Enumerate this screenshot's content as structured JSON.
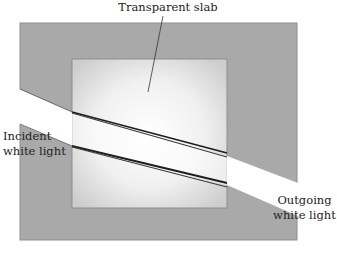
{
  "diagram": {
    "type": "optics-dispersion",
    "labels": {
      "slab": "Transparent slab",
      "incident_line1": "Incident",
      "incident_line2": "white light",
      "outgoing_line1": "Outgoing",
      "outgoing_line2": "white light"
    },
    "colors": {
      "outer_region": "#a9a9a9",
      "slab_center": "#ffffff",
      "slab_edge": "#cfcfcf",
      "beam": "#ffffff",
      "dispersion_lines": "#1e1e1e",
      "text": "#222222"
    }
  }
}
